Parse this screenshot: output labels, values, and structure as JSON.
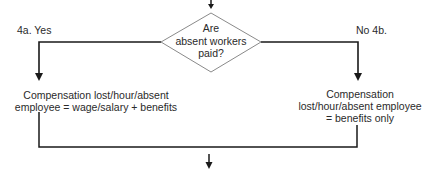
{
  "decision": {
    "lines": [
      "Are",
      "absent workers",
      "paid?"
    ]
  },
  "branches": {
    "yes": {
      "label": "4a.  Yes",
      "result_lines": [
        "Compensation lost/hour/absent",
        "employee = wage/salary + benefits"
      ]
    },
    "no": {
      "label": "No  4b.",
      "result_lines": [
        "Compensation",
        "lost/hour/absent employee",
        "= benefits only"
      ]
    }
  },
  "colors": {
    "line": "#1a1a1a",
    "diamond_stroke": "#8a8a8a",
    "text": "#2a2a2a",
    "background": "#ffffff"
  }
}
